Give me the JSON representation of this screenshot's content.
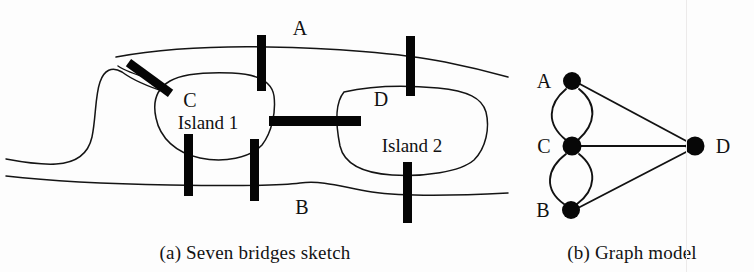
{
  "figure": {
    "background_color": "#fdfdfd",
    "ink_color": "#111111"
  },
  "panel_a": {
    "caption": "(a) Seven bridges sketch",
    "labels": {
      "bank_top": "A",
      "bank_bottom": "B",
      "island_left_letter": "C",
      "island_left_name": "Island 1",
      "island_right_letter": "D",
      "island_right_name": "Island 2"
    },
    "bridge_count": 7,
    "bridges": [
      {
        "name": "bridge-c-a-west",
        "orientation": "diagonal"
      },
      {
        "name": "bridge-c-a-east",
        "orientation": "vertical"
      },
      {
        "name": "bridge-d-a",
        "orientation": "vertical"
      },
      {
        "name": "bridge-c-b-west",
        "orientation": "vertical"
      },
      {
        "name": "bridge-c-b-east",
        "orientation": "vertical"
      },
      {
        "name": "bridge-c-d",
        "orientation": "horizontal"
      },
      {
        "name": "bridge-d-b",
        "orientation": "vertical"
      }
    ]
  },
  "panel_b": {
    "caption": "(b) Graph model",
    "nodes": [
      {
        "id": "A",
        "label": "A",
        "x": 572,
        "y": 81,
        "label_x": 544,
        "label_y": 81
      },
      {
        "id": "C",
        "label": "C",
        "x": 572,
        "y": 146,
        "label_x": 544,
        "label_y": 147
      },
      {
        "id": "B",
        "label": "B",
        "x": 571,
        "y": 210,
        "label_x": 543,
        "label_y": 211
      },
      {
        "id": "D",
        "label": "D",
        "x": 695,
        "y": 146,
        "label_x": 722,
        "label_y": 147
      }
    ],
    "edges": [
      {
        "from": "A",
        "to": "C",
        "style": "curve-left"
      },
      {
        "from": "A",
        "to": "C",
        "style": "curve-right"
      },
      {
        "from": "C",
        "to": "B",
        "style": "curve-left"
      },
      {
        "from": "C",
        "to": "B",
        "style": "curve-right"
      },
      {
        "from": "A",
        "to": "D",
        "style": "straight"
      },
      {
        "from": "C",
        "to": "D",
        "style": "straight"
      },
      {
        "from": "B",
        "to": "D",
        "style": "straight"
      }
    ],
    "edge_count": 7,
    "node_count": 4
  }
}
